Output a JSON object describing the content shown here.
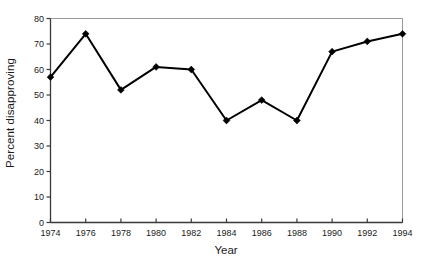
{
  "chart_data": {
    "type": "line",
    "title": "",
    "subtitle": "",
    "xlabel": "Year",
    "ylabel": "Percent disapproving",
    "x": [
      1974,
      1976,
      1978,
      1980,
      1982,
      1984,
      1986,
      1988,
      1990,
      1992,
      1994
    ],
    "values": [
      57,
      74,
      52,
      61,
      60,
      40,
      48,
      40,
      67,
      71,
      74
    ],
    "series": [
      {
        "name": "Percent disapproving",
        "values": [
          57,
          74,
          52,
          61,
          60,
          40,
          48,
          40,
          67,
          71,
          74
        ]
      }
    ],
    "xtick_labels": [
      "1974",
      "1976",
      "1978",
      "1980",
      "1982",
      "1984",
      "1986",
      "1988",
      "1990",
      "1992",
      "1994"
    ],
    "ytick_labels": [
      "0",
      "10",
      "20",
      "30",
      "40",
      "50",
      "60",
      "70",
      "80"
    ],
    "ytick_values": [
      0,
      10,
      20,
      30,
      40,
      50,
      60,
      70,
      80
    ],
    "xlim": [
      1974,
      1994
    ],
    "ylim": [
      0,
      80
    ],
    "grid": false,
    "legend": "none",
    "marker": "diamond",
    "line_color": "#000000",
    "marker_color": "#000000",
    "axis_color": "#3a3a3a",
    "frame_color": "#9a9a9a",
    "background_color": "#ffffff"
  }
}
